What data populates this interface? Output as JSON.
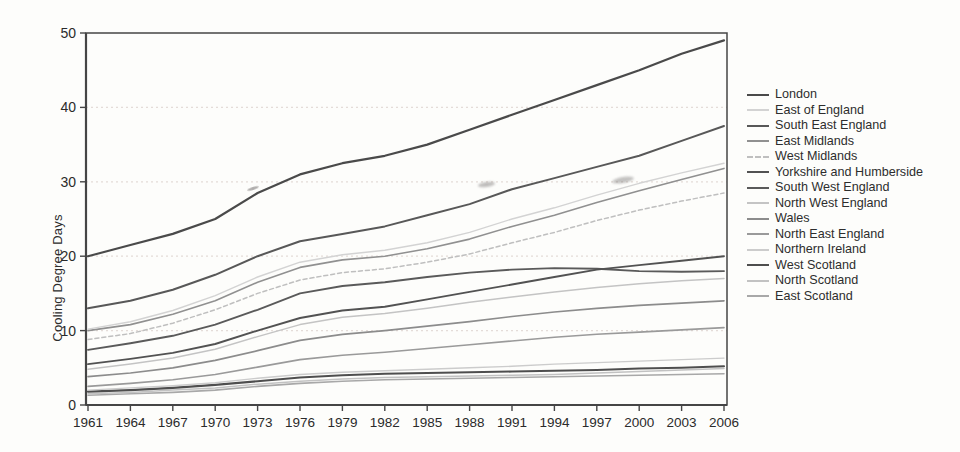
{
  "colors": {
    "background": "#fdfdfb",
    "axis": "#454545",
    "grid": "#e4dcd8",
    "tick_text": "#2b2b2b",
    "legend_text": "#2d2d2d"
  },
  "chart_data": {
    "type": "line",
    "title": "",
    "xlabel": "",
    "ylabel": "Cooling Degree Days",
    "xlim": [
      1961,
      2006
    ],
    "ylim": [
      0,
      50
    ],
    "grid": "horizontal-dotted",
    "legend_position": "right",
    "x": [
      1961,
      1964,
      1967,
      1970,
      1973,
      1976,
      1979,
      1982,
      1985,
      1988,
      1991,
      1994,
      1997,
      2000,
      2003,
      2006
    ],
    "x_tick_labels": [
      "1961",
      "1964",
      "1967",
      "1970",
      "1973",
      "1976",
      "1979",
      "1982",
      "1985",
      "1988",
      "1991",
      "1994",
      "1997",
      "2000",
      "2003",
      "2006"
    ],
    "y_ticks": [
      0,
      10,
      20,
      30,
      40,
      50
    ],
    "series": [
      {
        "name": "London",
        "color": "#4a4a4a",
        "width": 2.2,
        "dash": "",
        "values": [
          20.0,
          21.5,
          23.0,
          25.0,
          28.5,
          31.0,
          32.5,
          33.5,
          35.0,
          37.0,
          39.0,
          41.0,
          43.0,
          45.0,
          47.2,
          49.0
        ]
      },
      {
        "name": "East of England",
        "color": "#d3d3d3",
        "width": 1.4,
        "dash": "",
        "values": [
          10.2,
          11.2,
          12.7,
          14.7,
          17.2,
          19.2,
          20.2,
          20.8,
          21.8,
          23.2,
          25.0,
          26.5,
          28.2,
          29.8,
          31.2,
          32.5
        ]
      },
      {
        "name": "South East England",
        "color": "#585858",
        "width": 2.0,
        "dash": "",
        "values": [
          13.0,
          14.0,
          15.5,
          17.5,
          20.0,
          22.0,
          23.0,
          24.0,
          25.5,
          27.0,
          29.0,
          30.5,
          32.0,
          33.5,
          35.5,
          37.5
        ]
      },
      {
        "name": "East Midlands",
        "color": "#909090",
        "width": 1.6,
        "dash": "",
        "values": [
          10.0,
          10.8,
          12.2,
          14.0,
          16.5,
          18.5,
          19.5,
          20.0,
          21.0,
          22.3,
          24.0,
          25.5,
          27.2,
          28.8,
          30.3,
          31.8
        ]
      },
      {
        "name": "West Midlands",
        "color": "#bfbfbf",
        "width": 1.5,
        "dash": "4 3",
        "values": [
          8.8,
          9.6,
          11.0,
          12.8,
          15.0,
          16.8,
          17.8,
          18.3,
          19.2,
          20.3,
          21.8,
          23.2,
          24.8,
          26.2,
          27.4,
          28.5
        ]
      },
      {
        "name": "Yorkshire and Humberside",
        "color": "#525252",
        "width": 1.9,
        "dash": "",
        "values": [
          5.5,
          6.2,
          7.0,
          8.2,
          10.0,
          11.7,
          12.7,
          13.2,
          14.2,
          15.2,
          16.2,
          17.2,
          18.2,
          18.8,
          19.4,
          20.0
        ]
      },
      {
        "name": "South West England",
        "color": "#5a5a5a",
        "width": 1.9,
        "dash": "",
        "values": [
          7.4,
          8.3,
          9.3,
          10.8,
          12.8,
          15.0,
          16.0,
          16.5,
          17.2,
          17.8,
          18.2,
          18.4,
          18.3,
          18.0,
          17.9,
          18.0
        ]
      },
      {
        "name": "North West England",
        "color": "#c4c4c4",
        "width": 1.5,
        "dash": "",
        "values": [
          4.8,
          5.5,
          6.3,
          7.5,
          9.2,
          10.8,
          11.8,
          12.3,
          13.0,
          13.8,
          14.5,
          15.2,
          15.8,
          16.3,
          16.7,
          17.0
        ]
      },
      {
        "name": "Wales",
        "color": "#8c8c8c",
        "width": 1.7,
        "dash": "",
        "values": [
          3.8,
          4.3,
          5.0,
          6.0,
          7.3,
          8.7,
          9.5,
          10.0,
          10.6,
          11.2,
          11.9,
          12.5,
          13.0,
          13.4,
          13.7,
          14.0
        ]
      },
      {
        "name": "North East England",
        "color": "#9a9a9a",
        "width": 1.6,
        "dash": "",
        "values": [
          2.5,
          2.9,
          3.4,
          4.1,
          5.1,
          6.1,
          6.7,
          7.1,
          7.6,
          8.1,
          8.6,
          9.1,
          9.5,
          9.8,
          10.1,
          10.4
        ]
      },
      {
        "name": "Northern Ireland",
        "color": "#cccccc",
        "width": 1.4,
        "dash": "",
        "values": [
          2.0,
          2.3,
          2.6,
          3.0,
          3.6,
          4.1,
          4.4,
          4.6,
          4.8,
          5.0,
          5.2,
          5.5,
          5.7,
          5.9,
          6.1,
          6.3
        ]
      },
      {
        "name": "West Scotland",
        "color": "#4e4e4e",
        "width": 2.1,
        "dash": "",
        "values": [
          1.8,
          2.0,
          2.3,
          2.7,
          3.2,
          3.7,
          4.0,
          4.2,
          4.3,
          4.4,
          4.5,
          4.6,
          4.7,
          4.9,
          5.0,
          5.2
        ]
      },
      {
        "name": "North Scotland",
        "color": "#c2c2c2",
        "width": 1.5,
        "dash": "",
        "values": [
          1.5,
          1.7,
          2.0,
          2.3,
          2.8,
          3.2,
          3.5,
          3.7,
          3.8,
          3.9,
          4.0,
          4.1,
          4.3,
          4.5,
          4.7,
          4.9
        ]
      },
      {
        "name": "East Scotland",
        "color": "#a8a8a8",
        "width": 1.6,
        "dash": "",
        "values": [
          1.3,
          1.5,
          1.7,
          2.0,
          2.5,
          2.9,
          3.2,
          3.4,
          3.5,
          3.6,
          3.7,
          3.8,
          3.9,
          4.0,
          4.1,
          4.2
        ]
      }
    ]
  }
}
